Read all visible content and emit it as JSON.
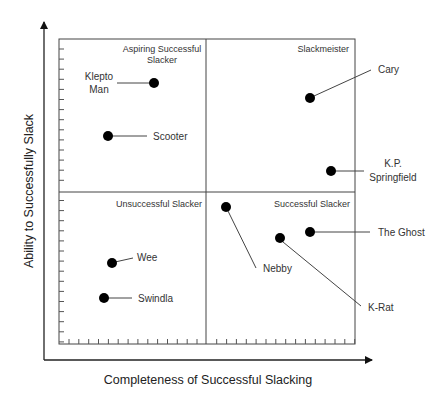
{
  "axes": {
    "x_label": "Completeness of Successful Slacking",
    "y_label": "Ability to Successfully Slack"
  },
  "quadrants": [
    {
      "id": "top-left",
      "lines": [
        "Aspiring Successful",
        "Slacker"
      ]
    },
    {
      "id": "top-right",
      "lines": [
        "Slackmeister"
      ]
    },
    {
      "id": "bottom-left",
      "lines": [
        "Unsuccessful Slacker"
      ]
    },
    {
      "id": "bottom-right",
      "lines": [
        "Successful Slacker"
      ]
    }
  ],
  "points": [
    {
      "name": "Klepto Man",
      "lines": [
        "Klepto",
        "Man"
      ],
      "quadrant": "Aspiring Successful Slacker"
    },
    {
      "name": "Scooter",
      "lines": [
        "Scooter"
      ],
      "quadrant": "Aspiring Successful Slacker"
    },
    {
      "name": "Cary",
      "lines": [
        "Cary"
      ],
      "quadrant": "Slackmeister"
    },
    {
      "name": "K.P. Springfield",
      "lines": [
        "K.P.",
        "Springfield"
      ],
      "quadrant": "Slackmeister"
    },
    {
      "name": "Wee",
      "lines": [
        "Wee"
      ],
      "quadrant": "Unsuccessful Slacker"
    },
    {
      "name": "Swindla",
      "lines": [
        "Swindla"
      ],
      "quadrant": "Unsuccessful Slacker"
    },
    {
      "name": "Nebby",
      "lines": [
        "Nebby"
      ],
      "quadrant": "Successful Slacker"
    },
    {
      "name": "The Ghost",
      "lines": [
        "The Ghost"
      ],
      "quadrant": "Successful Slacker"
    },
    {
      "name": "K-Rat",
      "lines": [
        "K-Rat"
      ],
      "quadrant": "Successful Slacker"
    }
  ],
  "chart_data": {
    "type": "scatter",
    "title": "",
    "xlabel": "Completeness of Successful Slacking",
    "ylabel": "Ability to Successfully Slack",
    "xlim": [
      0,
      100
    ],
    "ylim": [
      0,
      100
    ],
    "grid": false,
    "quadrant_divider": {
      "x": 50,
      "y": 50
    },
    "quadrant_labels": [
      "Aspiring Successful Slacker",
      "Slackmeister",
      "Unsuccessful Slacker",
      "Successful Slacker"
    ],
    "series": [
      {
        "name": "Slackers",
        "points": [
          {
            "label": "Klepto Man",
            "x": 31,
            "y": 86
          },
          {
            "label": "Scooter",
            "x": 16,
            "y": 68
          },
          {
            "label": "Cary",
            "x": 85,
            "y": 81
          },
          {
            "label": "K.P. Springfield",
            "x": 92,
            "y": 57
          },
          {
            "label": "Wee",
            "x": 18,
            "y": 27
          },
          {
            "label": "Swindla",
            "x": 15,
            "y": 15
          },
          {
            "label": "Nebby",
            "x": 56,
            "y": 45
          },
          {
            "label": "The Ghost",
            "x": 85,
            "y": 37
          },
          {
            "label": "K-Rat",
            "x": 75,
            "y": 35
          }
        ]
      }
    ]
  }
}
